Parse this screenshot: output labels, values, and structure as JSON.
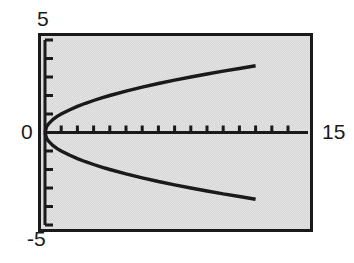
{
  "chart_data": {
    "type": "line",
    "title": "",
    "xlabel": "",
    "ylabel": "",
    "xlim": [
      0,
      15
    ],
    "ylim": [
      -5,
      5
    ],
    "grid": false,
    "legend": null,
    "frame": true,
    "background_color": "#d6d6d6",
    "line_color": "#1a1a1a",
    "axis_color": "#1a1a1a",
    "tick_labels": {
      "y_max": "5",
      "y_min": "-5",
      "origin": "0",
      "x_max": "15"
    },
    "x_ticks_count": 15,
    "y_ticks_count": 10,
    "x_tick_step": 1,
    "y_tick_step": 1,
    "series": [
      {
        "name": "upper-branch",
        "expression": "y = sqrt(x)",
        "x": [
          0,
          0.1,
          0.25,
          0.5,
          0.75,
          1,
          1.5,
          2,
          2.5,
          3,
          3.5,
          4,
          5,
          6,
          7,
          8,
          9,
          10,
          11,
          12,
          13
        ],
        "y": [
          0,
          0.32,
          0.5,
          0.71,
          0.87,
          1,
          1.22,
          1.41,
          1.58,
          1.73,
          1.87,
          2,
          2.24,
          2.45,
          2.65,
          2.83,
          3,
          3.16,
          3.32,
          3.46,
          3.61
        ]
      },
      {
        "name": "lower-branch",
        "expression": "y = -sqrt(x)",
        "x": [
          0,
          0.1,
          0.25,
          0.5,
          0.75,
          1,
          1.5,
          2,
          2.5,
          3,
          3.5,
          4,
          5,
          6,
          7,
          8,
          9,
          10,
          11,
          12,
          13
        ],
        "y": [
          0,
          -0.32,
          -0.5,
          -0.71,
          -0.87,
          -1,
          -1.22,
          -1.41,
          -1.58,
          -1.73,
          -1.87,
          -2,
          -2.24,
          -2.45,
          -2.65,
          -2.83,
          -3,
          -3.16,
          -3.32,
          -3.46,
          -3.61
        ]
      }
    ]
  }
}
